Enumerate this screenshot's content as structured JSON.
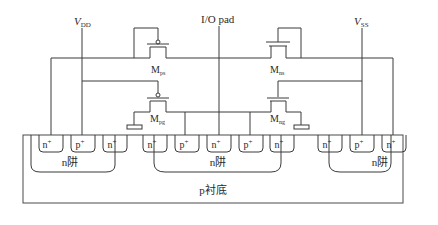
{
  "labels": {
    "vdd_main": "V",
    "vdd_sub": "DD",
    "vss_main": "V",
    "vss_sub": "SS",
    "io_pad": "I/O pad",
    "mps_main": "M",
    "mps_sub": "ps",
    "mns_main": "M",
    "mns_sub": "ns",
    "mpg_main": "M",
    "mpg_sub": "pg",
    "mng_main": "M",
    "mng_sub": "ng",
    "substrate": "p衬底",
    "nwell_left": "n阱",
    "nwell_center": "n阱",
    "nwell_right": "n阱"
  },
  "diffusions": [
    {
      "label": "n",
      "sup": "+"
    },
    {
      "label": "p",
      "sup": "+"
    },
    {
      "label": "n",
      "sup": "+"
    },
    {
      "label": "n",
      "sup": "+"
    },
    {
      "label": "p",
      "sup": "+"
    },
    {
      "label": "n",
      "sup": "+"
    },
    {
      "label": "p",
      "sup": "+"
    },
    {
      "label": "n",
      "sup": "+"
    },
    {
      "label": "n",
      "sup": "+"
    },
    {
      "label": "p",
      "sup": "+"
    },
    {
      "label": "n",
      "sup": "+"
    }
  ]
}
